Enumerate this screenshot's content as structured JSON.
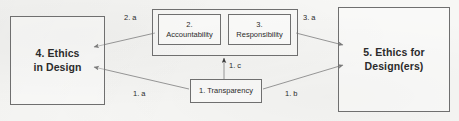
{
  "diagram": {
    "background_color": "#f7f7f5",
    "stroke_color": "#6f6f6f",
    "text_color": "#2b2b2b",
    "nodes": {
      "ethics_in_design": {
        "label": "4. Ethics\nin Design",
        "number": "4."
      },
      "ethics_for_designers": {
        "label": "5. Ethics for\nDesign(ers)",
        "number": "5."
      },
      "accountability": {
        "label": "2.\nAccountability",
        "number": "2."
      },
      "responsibility": {
        "label": "3.\nResponsibility",
        "number": "3."
      },
      "transparency": {
        "label": "1. Transparency",
        "number": "1."
      },
      "group_container": {
        "label": ""
      }
    },
    "edges": [
      {
        "id": "2a",
        "label": "2. a",
        "from": "accountability",
        "to": "ethics_in_design",
        "arrowhead": "to"
      },
      {
        "id": "3a",
        "label": "3. a",
        "from": "responsibility",
        "to": "ethics_for_designers",
        "arrowhead": "to"
      },
      {
        "id": "1a",
        "label": "1. a",
        "from": "transparency",
        "to": "ethics_in_design",
        "arrowhead": "to"
      },
      {
        "id": "1b",
        "label": "1. b",
        "from": "transparency",
        "to": "ethics_for_designers",
        "arrowhead": "to"
      },
      {
        "id": "1c",
        "label": "1. c",
        "from": "transparency",
        "to": "group_container",
        "arrowhead": "to"
      }
    ]
  }
}
